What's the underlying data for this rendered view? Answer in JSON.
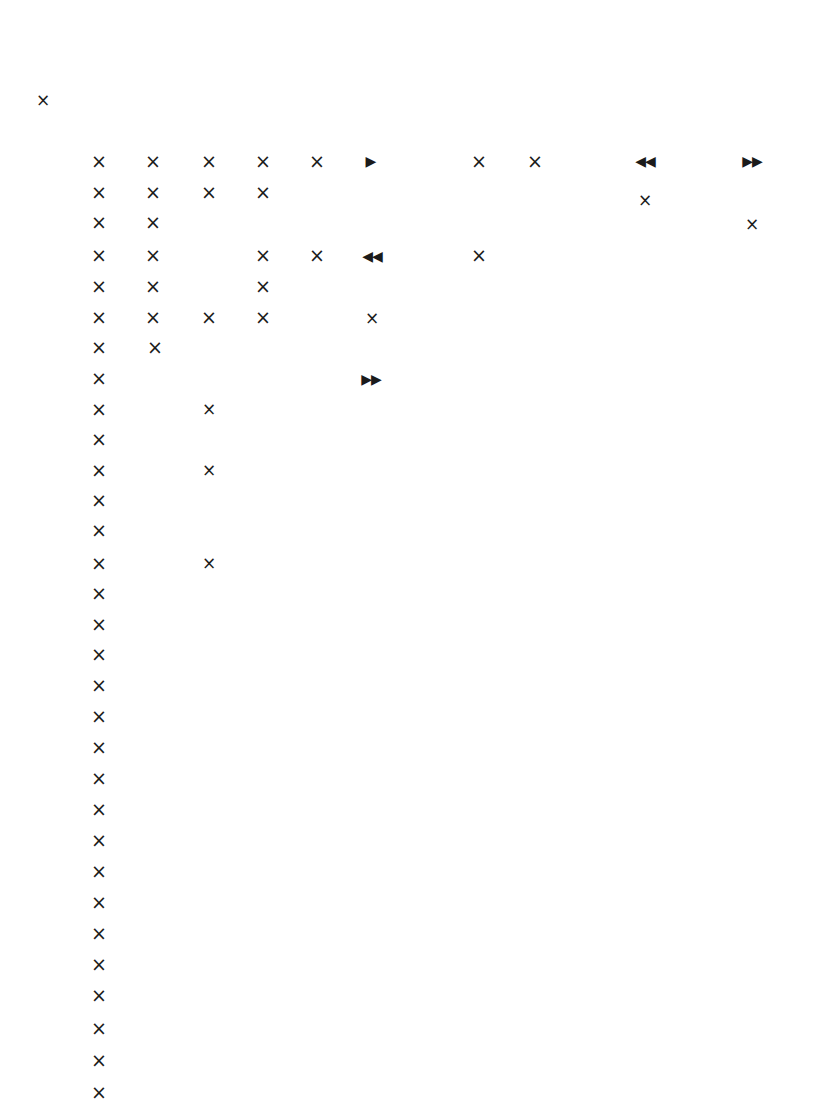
{
  "page": {
    "width": 816,
    "height": 1103,
    "background_color": "#ffffff",
    "glyph_color": "#1b1b1b"
  },
  "legend": {
    "cross": "×",
    "triangle_right": "▶",
    "triangle_double_left": "◀◀",
    "triangle_double_right": "▶▶"
  },
  "glyphs": [
    {
      "name": "glyph-isolated-cross",
      "kind": "cross-sm",
      "char": "×",
      "x": 43,
      "y": 100
    },
    {
      "name": "glyph-r1-c1",
      "kind": "cross",
      "char": "×",
      "x": 99,
      "y": 161
    },
    {
      "name": "glyph-r1-c2",
      "kind": "cross",
      "char": "×",
      "x": 153,
      "y": 161
    },
    {
      "name": "glyph-r1-c3",
      "kind": "cross",
      "char": "×",
      "x": 209,
      "y": 161
    },
    {
      "name": "glyph-r1-c4",
      "kind": "cross",
      "char": "×",
      "x": 263,
      "y": 161
    },
    {
      "name": "glyph-r1-c5",
      "kind": "cross",
      "char": "×",
      "x": 317,
      "y": 161
    },
    {
      "name": "glyph-r1-c6",
      "kind": "tri-single",
      "char": "▶",
      "x": 371,
      "y": 161
    },
    {
      "name": "glyph-r1-c8",
      "kind": "cross",
      "char": "×",
      "x": 479,
      "y": 161
    },
    {
      "name": "glyph-r1-c9",
      "kind": "cross",
      "char": "×",
      "x": 535,
      "y": 161
    },
    {
      "name": "glyph-r1-c11",
      "kind": "tri",
      "char": "◀◀",
      "x": 645,
      "y": 161
    },
    {
      "name": "glyph-r1-c13",
      "kind": "tri",
      "char": "▶▶",
      "x": 752,
      "y": 161
    },
    {
      "name": "glyph-r2-c1",
      "kind": "cross",
      "char": "×",
      "x": 99,
      "y": 192
    },
    {
      "name": "glyph-r2-c2",
      "kind": "cross",
      "char": "×",
      "x": 153,
      "y": 192
    },
    {
      "name": "glyph-r2-c3",
      "kind": "cross",
      "char": "×",
      "x": 209,
      "y": 192
    },
    {
      "name": "glyph-r2-c4",
      "kind": "cross",
      "char": "×",
      "x": 263,
      "y": 192
    },
    {
      "name": "glyph-r2-c11",
      "kind": "cross-sm",
      "char": "×",
      "x": 645,
      "y": 200
    },
    {
      "name": "glyph-r3-c1",
      "kind": "cross",
      "char": "×",
      "x": 99,
      "y": 222
    },
    {
      "name": "glyph-r3-c2",
      "kind": "cross",
      "char": "×",
      "x": 153,
      "y": 222
    },
    {
      "name": "glyph-r3-c13",
      "kind": "cross-sm",
      "char": "×",
      "x": 752,
      "y": 224
    },
    {
      "name": "glyph-r4-c1",
      "kind": "cross",
      "char": "×",
      "x": 99,
      "y": 255
    },
    {
      "name": "glyph-r4-c2",
      "kind": "cross",
      "char": "×",
      "x": 153,
      "y": 255
    },
    {
      "name": "glyph-r4-c4",
      "kind": "cross",
      "char": "×",
      "x": 263,
      "y": 255
    },
    {
      "name": "glyph-r4-c5",
      "kind": "cross",
      "char": "×",
      "x": 317,
      "y": 255
    },
    {
      "name": "glyph-r4-c6",
      "kind": "tri",
      "char": "◀◀",
      "x": 372,
      "y": 256
    },
    {
      "name": "glyph-r4-c8",
      "kind": "cross",
      "char": "×",
      "x": 479,
      "y": 255
    },
    {
      "name": "glyph-r5-c1",
      "kind": "cross",
      "char": "×",
      "x": 99,
      "y": 286
    },
    {
      "name": "glyph-r5-c2",
      "kind": "cross",
      "char": "×",
      "x": 153,
      "y": 286
    },
    {
      "name": "glyph-r5-c4",
      "kind": "cross",
      "char": "×",
      "x": 263,
      "y": 286
    },
    {
      "name": "glyph-r6-c1",
      "kind": "cross",
      "char": "×",
      "x": 99,
      "y": 317
    },
    {
      "name": "glyph-r6-c2",
      "kind": "cross",
      "char": "×",
      "x": 153,
      "y": 317
    },
    {
      "name": "glyph-r6-c3",
      "kind": "cross",
      "char": "×",
      "x": 209,
      "y": 317
    },
    {
      "name": "glyph-r6-c4",
      "kind": "cross",
      "char": "×",
      "x": 263,
      "y": 317
    },
    {
      "name": "glyph-r6-c6",
      "kind": "cross-sm",
      "char": "×",
      "x": 372,
      "y": 318
    },
    {
      "name": "glyph-r7-c1",
      "kind": "cross",
      "char": "×",
      "x": 99,
      "y": 347
    },
    {
      "name": "glyph-r7-c2",
      "kind": "cross",
      "char": "×",
      "x": 155,
      "y": 347
    },
    {
      "name": "glyph-r8-c1",
      "kind": "cross",
      "char": "×",
      "x": 99,
      "y": 378
    },
    {
      "name": "glyph-r8-c6",
      "kind": "tri",
      "char": "▶▶",
      "x": 371,
      "y": 379
    },
    {
      "name": "glyph-r9-c1",
      "kind": "cross",
      "char": "×",
      "x": 99,
      "y": 409
    },
    {
      "name": "glyph-r9-c3",
      "kind": "cross-sm",
      "char": "×",
      "x": 209,
      "y": 409
    },
    {
      "name": "glyph-r10-c1",
      "kind": "cross",
      "char": "×",
      "x": 99,
      "y": 439
    },
    {
      "name": "glyph-r11-c1",
      "kind": "cross",
      "char": "×",
      "x": 99,
      "y": 470
    },
    {
      "name": "glyph-r11-c3",
      "kind": "cross-sm",
      "char": "×",
      "x": 209,
      "y": 470
    },
    {
      "name": "glyph-r12-c1",
      "kind": "cross",
      "char": "×",
      "x": 99,
      "y": 500
    },
    {
      "name": "glyph-r13-c1",
      "kind": "cross",
      "char": "×",
      "x": 99,
      "y": 530
    },
    {
      "name": "glyph-r14-c1",
      "kind": "cross",
      "char": "×",
      "x": 99,
      "y": 563
    },
    {
      "name": "glyph-r14-c3",
      "kind": "cross-sm",
      "char": "×",
      "x": 209,
      "y": 563
    },
    {
      "name": "glyph-r15-c1",
      "kind": "cross",
      "char": "×",
      "x": 99,
      "y": 593
    },
    {
      "name": "glyph-r16-c1",
      "kind": "cross",
      "char": "×",
      "x": 99,
      "y": 624
    },
    {
      "name": "glyph-r17-c1",
      "kind": "cross",
      "char": "×",
      "x": 99,
      "y": 654
    },
    {
      "name": "glyph-r18-c1",
      "kind": "cross",
      "char": "×",
      "x": 99,
      "y": 685
    },
    {
      "name": "glyph-r19-c1",
      "kind": "cross",
      "char": "×",
      "x": 99,
      "y": 716
    },
    {
      "name": "glyph-r20-c1",
      "kind": "cross",
      "char": "×",
      "x": 99,
      "y": 747
    },
    {
      "name": "glyph-r21-c1",
      "kind": "cross",
      "char": "×",
      "x": 99,
      "y": 778
    },
    {
      "name": "glyph-r22-c1",
      "kind": "cross",
      "char": "×",
      "x": 99,
      "y": 809
    },
    {
      "name": "glyph-r23-c1",
      "kind": "cross",
      "char": "×",
      "x": 99,
      "y": 840
    },
    {
      "name": "glyph-r24-c1",
      "kind": "cross",
      "char": "×",
      "x": 99,
      "y": 871
    },
    {
      "name": "glyph-r25-c1",
      "kind": "cross",
      "char": "×",
      "x": 99,
      "y": 902
    },
    {
      "name": "glyph-r26-c1",
      "kind": "cross",
      "char": "×",
      "x": 99,
      "y": 933
    },
    {
      "name": "glyph-r27-c1",
      "kind": "cross",
      "char": "×",
      "x": 99,
      "y": 964
    },
    {
      "name": "glyph-r28-c1",
      "kind": "cross",
      "char": "×",
      "x": 99,
      "y": 995
    },
    {
      "name": "glyph-r29-c1",
      "kind": "cross",
      "char": "×",
      "x": 99,
      "y": 1028
    },
    {
      "name": "glyph-r30-c1",
      "kind": "cross",
      "char": "×",
      "x": 99,
      "y": 1060
    },
    {
      "name": "glyph-r31-c1",
      "kind": "cross",
      "char": "×",
      "x": 99,
      "y": 1092
    }
  ]
}
